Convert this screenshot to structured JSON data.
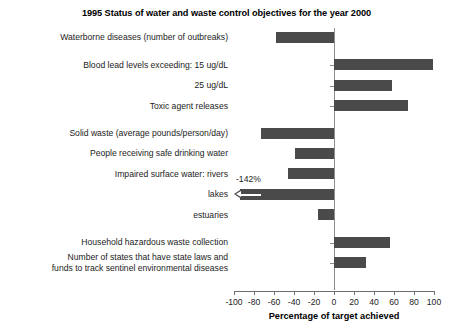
{
  "chart_data": {
    "type": "bar",
    "orientation": "horizontal",
    "title": "1995 Status of water and waste control objectives for the year 2000",
    "xlabel": "Percentage of target achieved",
    "ylabel": "",
    "xlim": [
      -100,
      100
    ],
    "xticks": [
      -100,
      -80,
      -60,
      -40,
      -20,
      0,
      20,
      40,
      60,
      80,
      100
    ],
    "xticklabels": [
      "-100",
      "-80",
      "-60",
      "-40",
      "-20",
      "0",
      "20",
      "40",
      "60",
      "80",
      "100"
    ],
    "grid": false,
    "legend": "none",
    "bar_color": "#4a4a4a",
    "axis_color": "#6e6e6e",
    "categories": [
      "Waterborne diseases (number of outbreaks)",
      "Blood lead levels exceeding: 15 ug/dL",
      "25 ug/dL",
      "Toxic agent releases",
      "Solid waste (average pounds/person/day)",
      "People receiving safe drinking water",
      "Impaired surface water: rivers",
      "lakes",
      "estuaries",
      "Household hazardous waste collection",
      "Number of states that have state laws and funds to track sentinel environmental diseases"
    ],
    "values": [
      -58,
      99,
      58,
      74,
      -73,
      -39,
      -46,
      -142,
      -16,
      56,
      32
    ],
    "annotations": [
      {
        "text": "-142%",
        "for_category": "lakes",
        "note": "bar clipped at axis minimum, drawn with leftward arrow"
      }
    ]
  },
  "categories_display": [
    {
      "lines": [
        "Waterborne diseases (number of outbreaks)"
      ],
      "value": -58,
      "clipped": false,
      "gap_before": false
    },
    {
      "lines": [
        "Blood lead levels exceeding: 15 ug/dL"
      ],
      "value": 99,
      "clipped": false,
      "gap_before": true
    },
    {
      "lines": [
        "25 ug/dL"
      ],
      "value": 58,
      "clipped": false,
      "gap_before": false
    },
    {
      "lines": [
        "Toxic agent releases"
      ],
      "value": 74,
      "clipped": false,
      "gap_before": false
    },
    {
      "lines": [
        "Solid waste (average pounds/person/day)"
      ],
      "value": -73,
      "clipped": false,
      "gap_before": true
    },
    {
      "lines": [
        "People receiving safe drinking water"
      ],
      "value": -39,
      "clipped": false,
      "gap_before": false
    },
    {
      "lines": [
        "Impaired surface water: rivers"
      ],
      "value": -46,
      "clipped": false,
      "gap_before": false
    },
    {
      "lines": [
        "lakes"
      ],
      "value": -142,
      "clipped": true,
      "gap_before": false
    },
    {
      "lines": [
        "estuaries"
      ],
      "value": -16,
      "clipped": false,
      "gap_before": false
    },
    {
      "lines": [
        "Household hazardous waste collection"
      ],
      "value": 56,
      "clipped": false,
      "gap_before": true
    },
    {
      "lines": [
        "Number of states that have state laws and",
        "funds to track sentinel environmental diseases"
      ],
      "value": 32,
      "clipped": false,
      "gap_before": false
    }
  ],
  "annotation_lakes": "-142%"
}
